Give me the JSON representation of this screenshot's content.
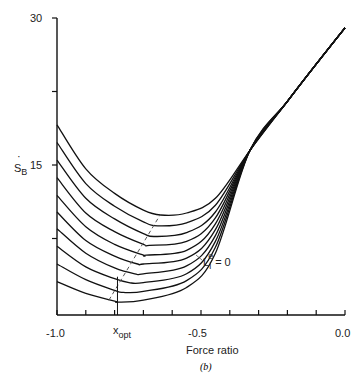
{
  "chart_data": {
    "type": "line",
    "panel_label": "(b)",
    "xlabel": "Force ratio",
    "ylabel": "Ṡ_B",
    "xlim": [
      -1.0,
      0.0
    ],
    "ylim": [
      0,
      30
    ],
    "x_ticks": [
      -1.0,
      -0.9,
      -0.8,
      -0.7,
      -0.6,
      -0.5,
      -0.4,
      -0.3,
      -0.2,
      -0.1,
      0.0
    ],
    "x_tick_labels": [
      {
        "x": -1.0,
        "label": "-1.0"
      },
      {
        "x": -0.5,
        "label": "-0.5"
      },
      {
        "x": 0.0,
        "label": "0.0"
      }
    ],
    "y_ticks": [
      0,
      7.5,
      15,
      22.5,
      30
    ],
    "y_tick_labels": [
      {
        "y": 15,
        "label": "15"
      },
      {
        "y": 30,
        "label": "30"
      }
    ],
    "x_opt": -0.79,
    "x_opt_label": "x_opt",
    "annotation": "L_i^e = 0",
    "optimum_locus": {
      "style": "dashed",
      "points": [
        [
          -0.82,
          1.2
        ],
        [
          -0.64,
          10.0
        ]
      ]
    },
    "series": [
      {
        "name": "curve-1",
        "x": [
          -1.0,
          -0.9,
          -0.8,
          -0.7,
          -0.64,
          -0.55,
          -0.45,
          -0.33,
          -0.2,
          -0.1,
          0.0
        ],
        "y": [
          19.1,
          14.6,
          12.1,
          10.4,
          9.9,
          10.1,
          11.6,
          16.5,
          21.5,
          25.3,
          29.0
        ]
      },
      {
        "name": "curve-2",
        "x": [
          -1.0,
          -0.9,
          -0.8,
          -0.7,
          -0.65,
          -0.55,
          -0.45,
          -0.33,
          -0.2,
          -0.1,
          0.0
        ],
        "y": [
          17.3,
          13.1,
          10.8,
          9.2,
          8.8,
          9.1,
          10.9,
          16.5,
          21.5,
          25.3,
          29.0
        ]
      },
      {
        "name": "curve-3",
        "x": [
          -1.0,
          -0.9,
          -0.8,
          -0.7,
          -0.66,
          -0.55,
          -0.45,
          -0.33,
          -0.2,
          -0.1,
          0.0
        ],
        "y": [
          15.5,
          11.6,
          9.5,
          8.0,
          7.7,
          8.1,
          10.2,
          16.5,
          21.5,
          25.3,
          29.0
        ]
      },
      {
        "name": "curve-4",
        "x": [
          -1.0,
          -0.9,
          -0.8,
          -0.7,
          -0.68,
          -0.55,
          -0.45,
          -0.33,
          -0.2,
          -0.1,
          0.0
        ],
        "y": [
          13.7,
          10.1,
          8.2,
          6.9,
          6.8,
          7.2,
          9.6,
          16.5,
          21.5,
          25.3,
          29.0
        ]
      },
      {
        "name": "curve-5",
        "x": [
          -1.0,
          -0.9,
          -0.8,
          -0.7,
          -0.69,
          -0.55,
          -0.45,
          -0.33,
          -0.2,
          -0.1,
          0.0
        ],
        "y": [
          11.9,
          8.7,
          6.9,
          5.8,
          5.8,
          6.3,
          9.0,
          16.5,
          21.5,
          25.3,
          29.0
        ]
      },
      {
        "name": "curve-6",
        "x": [
          -1.0,
          -0.9,
          -0.8,
          -0.72,
          -0.7,
          -0.55,
          -0.45,
          -0.33,
          -0.2,
          -0.1,
          0.0
        ],
        "y": [
          10.2,
          7.3,
          5.7,
          4.9,
          4.9,
          5.5,
          8.4,
          16.5,
          21.5,
          25.3,
          29.0
        ]
      },
      {
        "name": "curve-7",
        "x": [
          -1.0,
          -0.9,
          -0.8,
          -0.73,
          -0.7,
          -0.55,
          -0.45,
          -0.33,
          -0.2,
          -0.1,
          0.0
        ],
        "y": [
          8.5,
          6.0,
          4.5,
          3.9,
          3.9,
          4.7,
          7.8,
          16.5,
          21.5,
          25.3,
          29.0
        ]
      },
      {
        "name": "curve-8",
        "x": [
          -1.0,
          -0.9,
          -0.8,
          -0.75,
          -0.7,
          -0.55,
          -0.45,
          -0.33,
          -0.2,
          -0.1,
          0.0
        ],
        "y": [
          6.7,
          4.6,
          3.4,
          3.0,
          3.0,
          3.9,
          7.2,
          16.5,
          21.5,
          25.3,
          29.0
        ]
      },
      {
        "name": "curve-9",
        "x": [
          -1.0,
          -0.9,
          -0.8,
          -0.77,
          -0.7,
          -0.55,
          -0.45,
          -0.33,
          -0.2,
          -0.1,
          0.0
        ],
        "y": [
          4.9,
          3.3,
          2.2,
          2.0,
          2.1,
          3.2,
          6.6,
          16.5,
          21.5,
          25.3,
          29.0
        ]
      },
      {
        "name": "curve-10 (L_i^e = 0)",
        "x": [
          -1.0,
          -0.9,
          -0.8,
          -0.79,
          -0.7,
          -0.55,
          -0.45,
          -0.33,
          -0.2,
          -0.1,
          0.0
        ],
        "y": [
          3.1,
          1.9,
          1.1,
          1.0,
          1.2,
          2.5,
          6.0,
          16.5,
          21.5,
          25.3,
          29.0
        ]
      }
    ],
    "grid": false,
    "legend": null
  },
  "labels": {
    "ylabel_main": "S",
    "ylabel_sub": "B",
    "y30": "30",
    "y15": "15",
    "xm1": "-1.0",
    "xm05": "-0.5",
    "x0": "0.0",
    "xopt_main": "x",
    "xopt_sub": "opt",
    "xlabel": "Force ratio",
    "panel": "(b)",
    "annot_main": "L",
    "annot_sub": "i",
    "annot_sup": "e",
    "annot_eq": "= 0"
  }
}
